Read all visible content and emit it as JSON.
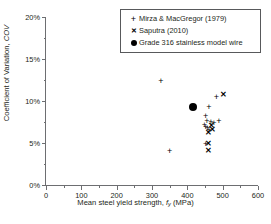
{
  "chart_data": {
    "type": "scatter",
    "title": "",
    "xlabel": "Mean steel yield strength, fy (MPa)",
    "ylabel": "Coefficient of Variation, COV",
    "xlim": [
      0,
      600
    ],
    "ylim": [
      0,
      20
    ],
    "xticks": [
      "0",
      "100",
      "200",
      "300",
      "400",
      "500",
      "600"
    ],
    "xtick_values": [
      0,
      100,
      200,
      300,
      400,
      500,
      600
    ],
    "ytick_values": [
      0,
      5,
      10,
      15,
      20
    ],
    "yticks": [
      "0%",
      "5%",
      "10%",
      "15%",
      "20%"
    ],
    "x_minor_step": 50,
    "y_minor_step": 2.5,
    "grid": false,
    "legend_position": "top-right",
    "series": [
      {
        "name": "Mirza & MacGregor (1979)",
        "marker": "plus",
        "points": [
          [
            325,
            12.4
          ],
          [
            350,
            4.1
          ],
          [
            452,
            8.2
          ],
          [
            461,
            9.3
          ],
          [
            482,
            10.5
          ],
          [
            455,
            7.6
          ],
          [
            448,
            7.1
          ],
          [
            452,
            6.9
          ],
          [
            457,
            6.8
          ],
          [
            467,
            7.5
          ],
          [
            475,
            7.4
          ],
          [
            489,
            7.6
          ],
          [
            461,
            6.6
          ],
          [
            452,
            4.9
          ]
        ]
      },
      {
        "name": "Saputra (2010)",
        "marker": "cross",
        "points": [
          [
            503,
            10.7
          ],
          [
            469,
            7.0
          ],
          [
            471,
            6.5
          ],
          [
            461,
            6.2
          ],
          [
            459,
            4.9
          ],
          [
            460,
            4.0
          ]
        ]
      },
      {
        "name": "Grade 316 stainless model wire",
        "marker": "circle",
        "points": [
          [
            415,
            9.3
          ]
        ]
      }
    ],
    "legend_entries": [
      {
        "key": "plus",
        "label": "Mirza & MacGregor (1979)"
      },
      {
        "key": "cross",
        "label": "Saputra (2010)"
      },
      {
        "key": "circle",
        "label": "Grade 316 stainless model wire"
      }
    ]
  },
  "axis_title_x": {
    "pre": "Mean steel yield strength, ",
    "symbol": "f",
    "sub": "y",
    "post": " (MPa)"
  },
  "axis_title_y": {
    "pre": "Coefficient of Variation, ",
    "symbol": "COV"
  }
}
